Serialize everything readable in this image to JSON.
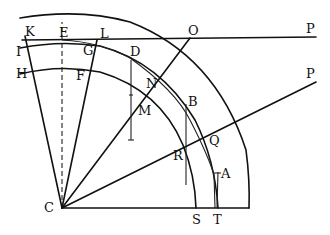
{
  "figure": {
    "labels": {
      "K": "K",
      "E": "E",
      "L": "L",
      "O": "O",
      "P_top": "P",
      "I": "I",
      "G": "G",
      "D": "D",
      "H": "H",
      "F": "F",
      "N": "N",
      "M": "M",
      "B": "B",
      "P_right": "P",
      "Q": "Q",
      "R": "R",
      "A": "A",
      "C": "C",
      "S": "S",
      "T": "T"
    }
  }
}
